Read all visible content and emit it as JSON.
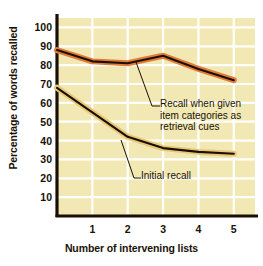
{
  "chart_data": {
    "type": "line",
    "title": "",
    "xlabel": "Number of intervening lists",
    "ylabel": "Percentage of words recalled",
    "x": [
      0,
      1,
      2,
      3,
      4,
      5
    ],
    "xtick_labels": [
      "1",
      "2",
      "3",
      "4",
      "5"
    ],
    "xticks": [
      1,
      2,
      3,
      4,
      5
    ],
    "xlim": [
      0,
      5.6
    ],
    "ytick_labels": [
      "100",
      "90",
      "80",
      "70",
      "60",
      "50",
      "40",
      "30",
      "20",
      "10"
    ],
    "yticks": [
      100,
      90,
      80,
      70,
      60,
      50,
      40,
      30,
      20,
      10
    ],
    "ylim": [
      0,
      105
    ],
    "grid": true,
    "grid_color": "#ffffff",
    "plot_background": "#f2e8b4",
    "legend_position": "inline-annotations",
    "series": [
      {
        "name": "Recall when given item categories as retrieval cues",
        "values": [
          88,
          82,
          81,
          85,
          78,
          72
        ],
        "line_color": "#e07b39",
        "outline_color": "#1a0f05"
      },
      {
        "name": "Initial recall",
        "values": [
          68,
          55,
          42,
          36,
          34,
          33
        ],
        "line_color": "#e8c877",
        "outline_color": "#1a0f05"
      }
    ],
    "annotations": [
      {
        "id": "cues",
        "text": "Recall when given\nitem categories as\nretrieval cues",
        "target_series": "Recall when given item categories as retrieval cues"
      },
      {
        "id": "initial",
        "text": "Initial recall",
        "target_series": "Initial recall"
      }
    ]
  }
}
